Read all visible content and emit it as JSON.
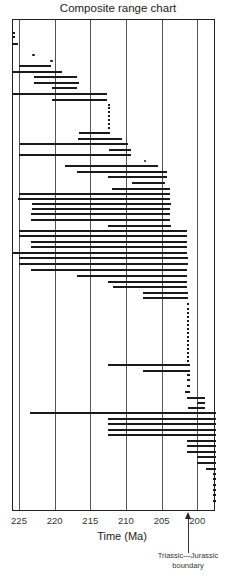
{
  "title": "Composite range chart",
  "annotation": {
    "line1": "Triassic—Jurassic",
    "line2": "boundary",
    "age": 201.3
  },
  "chart_data": {
    "type": "range",
    "title": "Composite range chart",
    "xlabel": "Time (Ma)",
    "ylabel": "",
    "x_reversed": true,
    "xlim": [
      226,
      197.4
    ],
    "x_ticks": [
      225,
      220,
      215,
      210,
      205,
      200
    ],
    "grid": true,
    "annotations": [
      {
        "text": "Triassic—Jurassic boundary",
        "x": 201.3,
        "type": "arrow"
      }
    ],
    "pixel_mapping": {
      "x_at_225": 19,
      "px_per_ma": 7.13
    },
    "bars": [
      {
        "y": 33,
        "start": 226.0,
        "end": 225.5
      },
      {
        "y": 37,
        "start": 226.0,
        "end": 225.5
      },
      {
        "y": 44,
        "start": 226.0,
        "end": 225.1
      },
      {
        "y": 66,
        "start": 225.0,
        "end": 220.5
      },
      {
        "y": 72,
        "start": 226.0,
        "end": 219.0
      },
      {
        "y": 77,
        "start": 222.9,
        "end": 216.8
      },
      {
        "y": 83,
        "start": 222.9,
        "end": 216.6
      },
      {
        "y": 88,
        "start": 220.4,
        "end": 216.8
      },
      {
        "y": 94,
        "start": 226.0,
        "end": 212.7
      },
      {
        "y": 100,
        "start": 220.4,
        "end": 212.6
      },
      {
        "y": 133,
        "start": 216.6,
        "end": 212.2
      },
      {
        "y": 139,
        "start": 216.7,
        "end": 210.6
      },
      {
        "y": 144,
        "start": 224.9,
        "end": 209.7
      },
      {
        "y": 150,
        "start": 212.4,
        "end": 209.3
      },
      {
        "y": 155,
        "start": 225.0,
        "end": 209.3
      },
      {
        "y": 166,
        "start": 218.6,
        "end": 205.5
      },
      {
        "y": 172,
        "start": 216.8,
        "end": 204.2
      },
      {
        "y": 177,
        "start": 212.5,
        "end": 204.2
      },
      {
        "y": 183,
        "start": 209.2,
        "end": 204.5
      },
      {
        "y": 189,
        "start": 212.0,
        "end": 203.8
      },
      {
        "y": 194,
        "start": 225.0,
        "end": 203.8
      },
      {
        "y": 199,
        "start": 225.1,
        "end": 203.8
      },
      {
        "y": 204,
        "start": 223.2,
        "end": 203.7
      },
      {
        "y": 209,
        "start": 223.2,
        "end": 203.8
      },
      {
        "y": 214,
        "start": 223.3,
        "end": 203.8
      },
      {
        "y": 220,
        "start": 223.3,
        "end": 203.8
      },
      {
        "y": 226,
        "start": 212.5,
        "end": 203.7
      },
      {
        "y": 231,
        "start": 225.0,
        "end": 201.4
      },
      {
        "y": 236,
        "start": 225.0,
        "end": 201.4
      },
      {
        "y": 242,
        "start": 223.3,
        "end": 201.4
      },
      {
        "y": 247,
        "start": 223.3,
        "end": 201.4
      },
      {
        "y": 253,
        "start": 226.0,
        "end": 201.4
      },
      {
        "y": 258,
        "start": 225.0,
        "end": 201.3
      },
      {
        "y": 264,
        "start": 225.0,
        "end": 201.3
      },
      {
        "y": 270,
        "start": 223.3,
        "end": 201.4
      },
      {
        "y": 276,
        "start": 216.8,
        "end": 201.4
      },
      {
        "y": 282,
        "start": 212.5,
        "end": 201.4
      },
      {
        "y": 287,
        "start": 211.8,
        "end": 201.4
      },
      {
        "y": 293,
        "start": 207.6,
        "end": 201.3
      },
      {
        "y": 298,
        "start": 207.6,
        "end": 201.3
      },
      {
        "y": 365,
        "start": 212.5,
        "end": 201.0
      },
      {
        "y": 371,
        "start": 207.6,
        "end": 201.0
      },
      {
        "y": 375,
        "start": 201.4,
        "end": 201.0
      },
      {
        "y": 380,
        "start": 201.4,
        "end": 201.0
      },
      {
        "y": 386,
        "start": 201.4,
        "end": 201.0
      },
      {
        "y": 392,
        "start": 201.7,
        "end": 201.0
      },
      {
        "y": 398,
        "start": 201.4,
        "end": 198.9
      },
      {
        "y": 403,
        "start": 200.0,
        "end": 198.9
      },
      {
        "y": 408,
        "start": 201.3,
        "end": 198.9
      },
      {
        "y": 413,
        "start": 223.5,
        "end": 197.4
      },
      {
        "y": 419,
        "start": 212.5,
        "end": 197.4
      },
      {
        "y": 424,
        "start": 212.5,
        "end": 197.4
      },
      {
        "y": 430,
        "start": 212.5,
        "end": 197.4
      },
      {
        "y": 435,
        "start": 212.5,
        "end": 197.4
      },
      {
        "y": 441,
        "start": 201.4,
        "end": 197.4
      },
      {
        "y": 446,
        "start": 201.4,
        "end": 197.4
      },
      {
        "y": 452,
        "start": 201.4,
        "end": 197.4
      },
      {
        "y": 457,
        "start": 200.0,
        "end": 197.4
      },
      {
        "y": 463,
        "start": 200.0,
        "end": 197.4
      },
      {
        "y": 469,
        "start": 198.8,
        "end": 197.4
      },
      {
        "y": 474,
        "start": 197.8,
        "end": 197.4
      },
      {
        "y": 479,
        "start": 197.8,
        "end": 197.4
      },
      {
        "y": 485,
        "start": 197.8,
        "end": 197.4
      },
      {
        "y": 490,
        "start": 197.8,
        "end": 197.4
      },
      {
        "y": 495,
        "start": 197.8,
        "end": 197.4
      },
      {
        "y": 501,
        "start": 197.8,
        "end": 197.4
      }
    ],
    "points": [
      {
        "y": 55,
        "age": 223.0
      },
      {
        "y": 61,
        "age": 220.4
      },
      {
        "y": 161,
        "age": 207.3
      }
    ],
    "dotted_ranges": [
      {
        "age": 212.4,
        "y_start": 104,
        "y_end": 129
      },
      {
        "age": 201.3,
        "y_start": 303,
        "y_end": 362
      }
    ]
  }
}
